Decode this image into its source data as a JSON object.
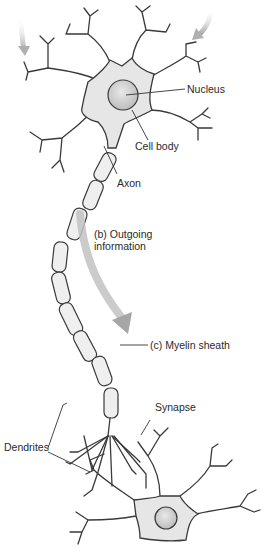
{
  "figure": {
    "colors": {
      "outline": "#3a3a3a",
      "cell_fill": "#e6e6e6",
      "nucleus_fill": "#cfcfcf",
      "myelin_fill": "#efefef",
      "arrow": "#b9b9b9",
      "label_text": "#2a2a2a"
    }
  },
  "labels": {
    "nucleus": "Nucleus",
    "cell_body": "Cell body",
    "axon": "Axon",
    "outgoing_line1": "(b) Outgoing",
    "outgoing_line2": "information",
    "myelin": "(c) Myelin sheath",
    "synapse": "Synapse",
    "dendrites": "Dendrites"
  }
}
